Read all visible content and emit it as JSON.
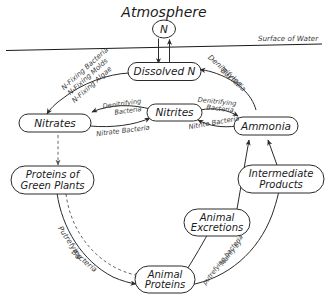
{
  "figure": {
    "title": "Atmosphere",
    "surface_label": "Surface of Water",
    "atmosphere_symbol": "N"
  },
  "nodes": {
    "dissolved_n": "Dissolved  N",
    "nitrates": "Nitrates",
    "nitrites": "Nitrites",
    "ammonia": "Ammonia",
    "proteins_green_plants_line1": "Proteins of",
    "proteins_green_plants_line2": "Green Plants",
    "animal_proteins_line1": "Animal",
    "animal_proteins_line2": "Proteins",
    "animal_excretions_line1": "Animal",
    "animal_excretions_line2": "Excretions",
    "intermediate_products_line1": "Intermediate",
    "intermediate_products_line2": "Products"
  },
  "edge_labels": {
    "n_fixing_bacteria": "N-Fixing Bacteria",
    "n_fixing_molds": "N-Fixing Molds",
    "n_fixing_algae": "N-Fixing Algae",
    "denitrifying_outer_line1": "Denitrifying",
    "denitrifying_outer_line2": "Bacteria",
    "denitrifying_inner_line1": "Denitrifying",
    "denitrifying_inner_line2": "Bacteria",
    "nitrate_bacteria": "Nitrate Bacteria",
    "nitrite_bacteria": "Nitrite Bacteria",
    "putrefying_line1": "Putrefying",
    "putrefying_line2": "Bacteria",
    "mainly_by_line1": "Mainly by",
    "mainly_by_line2": "putrefying bacteria"
  },
  "style": {
    "ink": "#2a2a2a",
    "ink_soft": "#3a3a3a",
    "paper": "#ffffff"
  }
}
